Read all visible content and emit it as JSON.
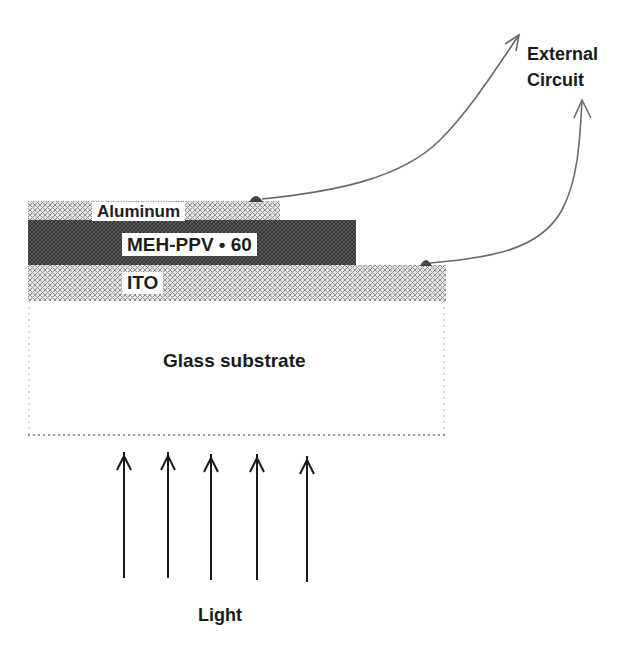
{
  "diagram": {
    "type": "device cross-section",
    "layers": [
      {
        "id": "aluminum",
        "label": "Aluminum",
        "pattern": "light-crosshatch"
      },
      {
        "id": "active",
        "label": "MEH-PPV • 60",
        "pattern": "dark-crosshatch"
      },
      {
        "id": "ito",
        "label": "ITO",
        "pattern": "light-crosshatch"
      },
      {
        "id": "glass",
        "label": "Glass substrate",
        "pattern": "blank-dotted-border"
      }
    ],
    "external_circuit": {
      "label_line1": "External",
      "label_line2": "Circuit"
    },
    "light": {
      "label": "Light",
      "arrow_count": 5,
      "direction": "up"
    },
    "colors": {
      "background": "#ffffff",
      "hatch_light": "#8a8a8a",
      "hatch_dark": "#3a3a3a",
      "wire": "#6a6a6a",
      "text": "#1a1a1a"
    }
  }
}
